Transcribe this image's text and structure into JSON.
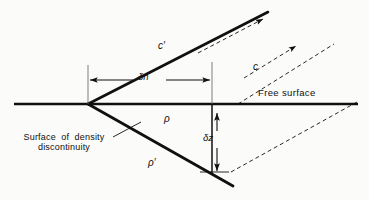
{
  "figure": {
    "type": "technical-line-diagram",
    "background_color": "#fbfbfa",
    "ink_color": "#101010"
  },
  "labels": {
    "free_surface": "Free surface",
    "surface_of_density_line1": "Surface  of  density",
    "surface_of_density_line2": "discontinuity",
    "wave_speed_upper": "c′",
    "wave_speed_lower": "c",
    "delta_n": "δn",
    "delta_z": "δz",
    "density_upper": "ρ",
    "density_lower": "ρ′"
  },
  "geometry": {
    "free_surface_line": {
      "x1": 14,
      "y1": 104,
      "x2": 358,
      "y2": 104
    },
    "apex": {
      "x": 88,
      "y": 104
    },
    "upper_ray_cprime": {
      "x1": 88,
      "y1": 104,
      "x2": 268,
      "y2": 12
    },
    "lower_wedge_line": {
      "x1": 88,
      "y1": 104,
      "x2": 233,
      "y2": 186
    },
    "vertical_delta_z_line": {
      "x": 212,
      "y1": 104,
      "y2": 174
    },
    "dimension_delta_n": {
      "x1": 88,
      "x2": 212,
      "y": 80
    },
    "dimension_delta_z": {
      "x": 217,
      "y1": 112,
      "y2": 172
    },
    "tick_left": {
      "x": 88,
      "y1": 65,
      "y2": 104
    },
    "tick_right": {
      "x": 212,
      "y1": 62,
      "y2": 104
    },
    "dashed_ray_c_upper": {
      "x1": 240,
      "y1": 104,
      "x2": 330,
      "y2": 47
    },
    "dashed_ray_c_lower": {
      "x1": 232,
      "y1": 172,
      "x2": 356,
      "y2": 103
    },
    "dashed_arrow_cprime": {
      "x1": 200,
      "y1": 52,
      "x2": 262,
      "y2": 19
    },
    "leader_surface_density": {
      "x1": 116,
      "y1": 136,
      "x2": 142,
      "y2": 122
    }
  },
  "annotations": {
    "arrow_count": 6,
    "dashed_lines": 4,
    "solid_lines": 4
  }
}
